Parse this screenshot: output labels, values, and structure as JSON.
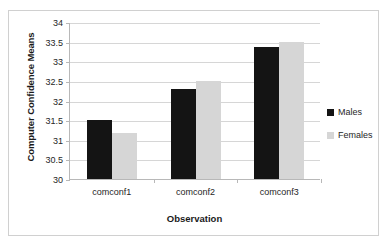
{
  "chart_data": {
    "type": "bar",
    "title": "",
    "subtitle": "",
    "xlabel": "Observation",
    "ylabel": "Computer Confidence Means",
    "categories": [
      "comconf1",
      "comconf2",
      "comconf3"
    ],
    "series": [
      {
        "name": "Males",
        "color": "#141414",
        "values": [
          31.5,
          32.3,
          33.37
        ]
      },
      {
        "name": "Females",
        "color": "#d6d6d6",
        "values": [
          31.17,
          32.5,
          33.5
        ]
      }
    ],
    "ylim": [
      30,
      34
    ],
    "ytick_labels": [
      "30",
      "30.5",
      "31",
      "31.5",
      "32",
      "32.5",
      "33",
      "33.5",
      "34"
    ],
    "ytick_values": [
      30,
      30.5,
      31,
      31.5,
      32,
      32.5,
      33,
      33.5,
      34
    ],
    "grid": true,
    "grid_axis": "y",
    "legend_position": "right",
    "plot_background": "#ffffff",
    "grid_color": "#d6d6d6",
    "axis_color": "#b8b8b8",
    "border_color": "#d0d0d0"
  }
}
